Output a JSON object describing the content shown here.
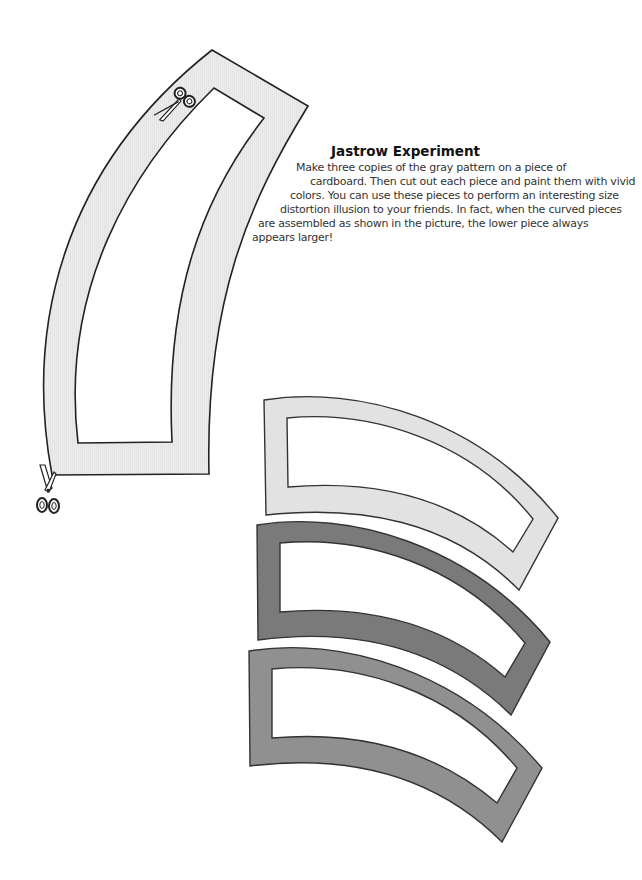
{
  "title": "Jastrow Experiment",
  "body_lines": [
    "Make three copies of the gray pattern on a piece of",
    "cardboard. Then cut out each piece and paint them with vivid",
    "colors. You can use these pieces to perform an interesting size",
    "distortion illusion to your friends. In fact, when the curved pieces",
    "are assembled as shown in the picture, the lower piece always",
    "appears larger!"
  ],
  "pattern": {
    "label": "gray pattern template",
    "fill": "#ebebeb",
    "stroke": "#222222",
    "scissors_icons": [
      "scissors-top",
      "scissors-bottom-left"
    ]
  },
  "assembled_pieces": [
    {
      "name": "top-piece",
      "fill": "#e3e3e3"
    },
    {
      "name": "middle-piece",
      "fill": "#7b7b7b"
    },
    {
      "name": "bottom-piece",
      "fill": "#929292"
    }
  ]
}
